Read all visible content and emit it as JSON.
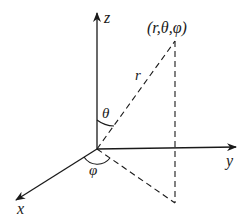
{
  "diagram": {
    "axes": {
      "x": "x",
      "y": "y",
      "z": "z"
    },
    "point_label": "(r,θ,φ)",
    "radius_label": "r",
    "polar_angle_label": "θ",
    "azimuth_angle_label": "φ",
    "colors": {
      "stroke": "#1a1a1a",
      "background": "#ffffff"
    }
  }
}
